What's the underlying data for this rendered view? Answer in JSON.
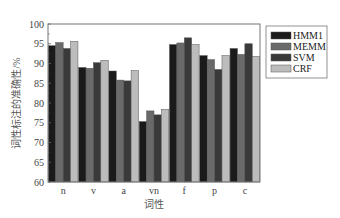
{
  "chart_data": {
    "type": "bar",
    "title": "",
    "xlabel": "词性",
    "ylabel": "词性标注的准确性/%",
    "ylim": [
      60,
      100
    ],
    "yticks": [
      60,
      65,
      70,
      75,
      80,
      85,
      90,
      95,
      100
    ],
    "categories": [
      "n",
      "v",
      "a",
      "vn",
      "f",
      "p",
      "c"
    ],
    "series": [
      {
        "name": "HMM1",
        "color": "#1a1a1a",
        "values": [
          94.5,
          89.0,
          88.1,
          75.3,
          94.8,
          92.0,
          93.8
        ]
      },
      {
        "name": "MEMM",
        "color": "#6a6a6a",
        "values": [
          95.3,
          88.8,
          85.8,
          78.0,
          95.2,
          91.0,
          92.3
        ]
      },
      {
        "name": "SVM",
        "color": "#3a3a3a",
        "values": [
          93.8,
          90.2,
          85.6,
          77.0,
          96.5,
          88.5,
          95.0
        ]
      },
      {
        "name": "CRF",
        "color": "#bcbcbc",
        "values": [
          95.6,
          90.8,
          88.2,
          78.4,
          94.8,
          92.0,
          91.8
        ]
      }
    ],
    "legend": "right",
    "grid": false
  }
}
